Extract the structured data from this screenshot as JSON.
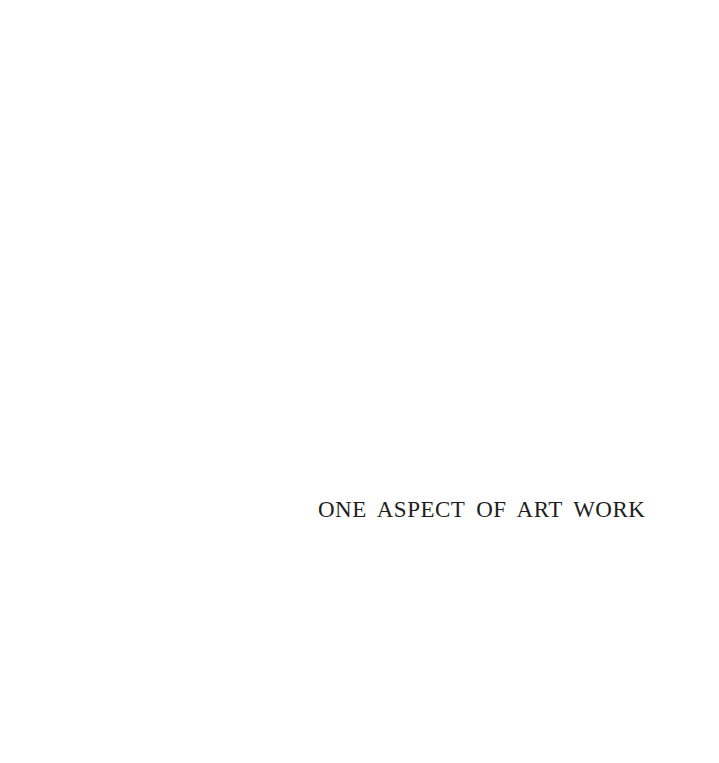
{
  "page": {
    "title": "ONE ASPECT OF ART WORK"
  }
}
